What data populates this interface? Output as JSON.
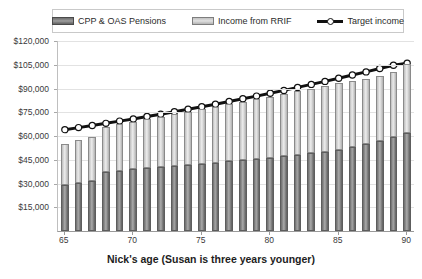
{
  "chart_data": {
    "type": "bar",
    "subtype": "stacked-bar-with-line-overlay",
    "title": "",
    "xlabel": "Nick's age (Susan is three years younger)",
    "ylabel": "",
    "ylim": [
      0,
      120000
    ],
    "ytick_labels": [
      "$120,000",
      "$105,000",
      "$90,000",
      "$75,000",
      "$60,000",
      "$45,000",
      "$30,000",
      "$15,000"
    ],
    "ytick_values": [
      120000,
      105000,
      90000,
      75000,
      60000,
      45000,
      30000,
      15000
    ],
    "ytick_interval": 15000,
    "grid": true,
    "grid_axis": "y",
    "legend_position": "top",
    "xtick_labels": [
      "65",
      "70",
      "75",
      "80",
      "85",
      "90"
    ],
    "xtick_values": [
      65,
      70,
      75,
      80,
      85,
      90
    ],
    "categories": [
      65,
      66,
      67,
      68,
      69,
      70,
      71,
      72,
      73,
      74,
      75,
      76,
      77,
      78,
      79,
      80,
      81,
      82,
      83,
      84,
      85,
      86,
      87,
      88,
      89,
      90
    ],
    "series": [
      {
        "name": "CPP & OAS Pensions",
        "color": "#8a8a8a",
        "stack": "income",
        "values": [
          29000,
          30500,
          31500,
          37500,
          38200,
          38900,
          39600,
          40300,
          41000,
          41700,
          42400,
          43200,
          44000,
          44800,
          45600,
          46400,
          47300,
          48200,
          49100,
          50000,
          51200,
          53000,
          55000,
          57000,
          59500,
          62000
        ]
      },
      {
        "name": "Income from RRIF",
        "color": "#dcdcdc",
        "stack": "income",
        "values": [
          26000,
          26800,
          27600,
          28100,
          29100,
          30000,
          31000,
          31800,
          32700,
          33600,
          34500,
          35200,
          36000,
          36800,
          37600,
          38500,
          39300,
          40000,
          40800,
          41600,
          42100,
          41600,
          41200,
          41000,
          41000,
          43500
        ]
      }
    ],
    "overlay": {
      "name": "Target income",
      "type": "line",
      "color": "#111111",
      "marker": "circle",
      "marker_fill": "#ffffff",
      "values": [
        64000,
        65300,
        66600,
        68000,
        69400,
        70800,
        72300,
        73800,
        75300,
        76900,
        78500,
        80100,
        81800,
        83500,
        85200,
        87000,
        88800,
        90700,
        92600,
        94500,
        96500,
        98500,
        100500,
        102600,
        104700,
        106000
      ]
    }
  },
  "legend": {
    "items": [
      {
        "label": "CPP & OAS Pensions",
        "swatch": "dark-gray-bar-swatch"
      },
      {
        "label": "Income from RRIF",
        "swatch": "light-gray-bar-swatch"
      },
      {
        "label": "Target income",
        "swatch": "black-line-circle-marker-swatch"
      }
    ]
  },
  "axis": {
    "x_title": "Nick's age (Susan is three years younger)"
  },
  "colors": {
    "cpp_fill": "#8a8a8a",
    "cpp_border": "#5d5d5d",
    "rrif_fill": "#dcdcdc",
    "rrif_border": "#8a8a8a",
    "target_line": "#111111",
    "target_marker_fill": "#ffffff",
    "gridline": "#e2e2e2",
    "axis_line": "#9a9a9a",
    "text": "#3a3a3a",
    "background": "#ffffff"
  }
}
